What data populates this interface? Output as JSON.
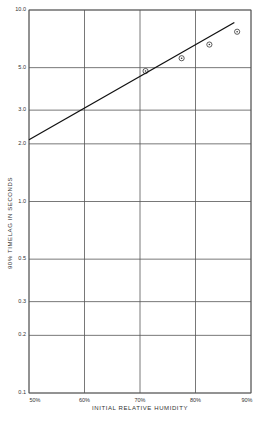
{
  "chart_data": {
    "type": "scatter",
    "title": "",
    "xlabel": "INITIAL RELATIVE HUMIDITY",
    "ylabel": "90% TIMELAG IN SECONDS",
    "x_ticks": [
      "50%",
      "60%",
      "70%",
      "80%",
      "90%"
    ],
    "y_ticks": [
      "10.0",
      "5.0",
      "3.0",
      "2.0",
      "1.0",
      "0.5",
      "0.3",
      "0.2",
      "0.1"
    ],
    "xlim": [
      50,
      90
    ],
    "ylim": [
      0.1,
      10.0
    ],
    "y_scale": "log",
    "grid": true,
    "legend": null,
    "series": [
      {
        "name": "observed",
        "type": "scatter",
        "marker": "circle-dot",
        "x": [
          71,
          77.5,
          82.5,
          87.5
        ],
        "y": [
          4.8,
          5.6,
          6.6,
          7.7
        ]
      },
      {
        "name": "fitted line",
        "type": "line",
        "x": [
          50,
          87
        ],
        "y": [
          2.1,
          8.6
        ]
      }
    ]
  }
}
